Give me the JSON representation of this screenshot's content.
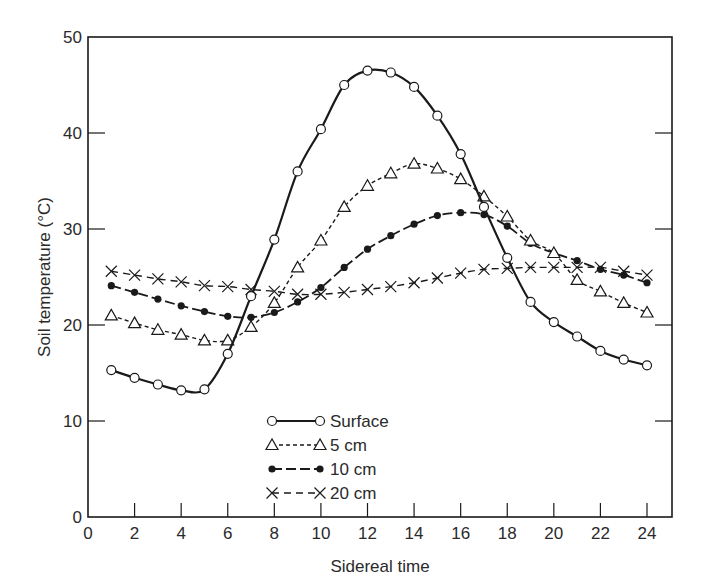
{
  "chart_data": {
    "type": "line",
    "title": "",
    "xlabel": "Sidereal time",
    "ylabel": "Soil temperature (°C)",
    "xlim": [
      0,
      25
    ],
    "ylim": [
      0,
      50
    ],
    "xticks": [
      0,
      2,
      4,
      6,
      8,
      10,
      12,
      14,
      16,
      18,
      20,
      22,
      24
    ],
    "yticks": [
      0,
      10,
      20,
      30,
      40,
      50
    ],
    "grid": false,
    "legend_position": "lower center",
    "x": [
      1,
      2,
      3,
      4,
      5,
      6,
      7,
      8,
      9,
      10,
      11,
      12,
      13,
      14,
      15,
      16,
      17,
      18,
      19,
      20,
      21,
      22,
      23,
      24
    ],
    "series": [
      {
        "name": "Surface",
        "marker": "open-circle",
        "line_style": "solid",
        "values": [
          15.3,
          14.5,
          13.8,
          13.2,
          13.3,
          17.0,
          23.0,
          28.9,
          36.0,
          40.4,
          45.0,
          46.5,
          46.3,
          44.8,
          41.8,
          37.8,
          32.3,
          27.0,
          22.4,
          20.3,
          18.8,
          17.3,
          16.4,
          15.8
        ]
      },
      {
        "name": "5 cm",
        "marker": "open-triangle",
        "line_style": "dashed",
        "values": [
          21.0,
          20.2,
          19.5,
          19.0,
          18.4,
          18.4,
          19.8,
          22.3,
          26.0,
          28.8,
          32.3,
          34.5,
          35.8,
          36.8,
          36.3,
          35.2,
          33.4,
          31.3,
          28.8,
          27.5,
          24.7,
          23.5,
          22.3,
          21.3
        ]
      },
      {
        "name": "10 cm",
        "marker": "filled-circle",
        "line_style": "long-dash",
        "values": [
          24.1,
          23.4,
          22.7,
          22.0,
          21.4,
          20.9,
          20.8,
          21.3,
          22.4,
          23.9,
          26.0,
          27.9,
          29.3,
          30.5,
          31.4,
          31.7,
          31.5,
          30.3,
          28.5,
          27.5,
          26.7,
          25.8,
          25.2,
          24.4
        ]
      },
      {
        "name": "20 cm",
        "marker": "cross",
        "line_style": "dash",
        "values": [
          25.6,
          25.2,
          24.8,
          24.5,
          24.1,
          24.0,
          23.7,
          23.5,
          23.2,
          23.2,
          23.4,
          23.7,
          24.0,
          24.4,
          24.9,
          25.4,
          25.8,
          25.9,
          26.0,
          26.0,
          26.0,
          26.0,
          25.6,
          25.2
        ]
      }
    ]
  },
  "legend": {
    "items": [
      {
        "label": "Surface"
      },
      {
        "label": "5 cm"
      },
      {
        "label": "10 cm"
      },
      {
        "label": "20 cm"
      }
    ]
  },
  "colors": {
    "ink": "#1a1a1a",
    "background": "#ffffff"
  }
}
